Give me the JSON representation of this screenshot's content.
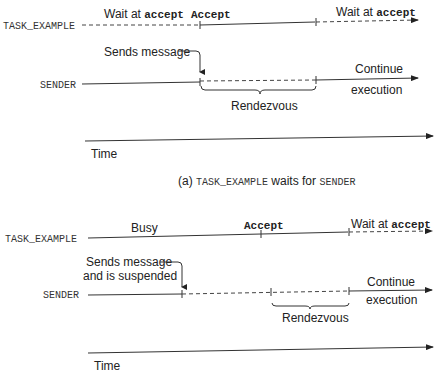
{
  "panel_a": {
    "caption_prefix": "(a) ",
    "caption_task": "TASK_EXAMPLE",
    "caption_mid": " waits for ",
    "caption_sender": "SENDER",
    "task_label": "TASK_EXAMPLE",
    "sender_label": "SENDER",
    "wait_prefix_1": "Wait at ",
    "wait_kw_1": "accept",
    "accept_label": "Accept",
    "wait_prefix_2": "Wait at ",
    "wait_kw_2": "accept",
    "sends_message": "Sends message",
    "continue_1": "Continue",
    "continue_2": "execution",
    "rendezvous": "Rendezvous",
    "time": "Time"
  },
  "panel_b": {
    "task_label": "TASK_EXAMPLE",
    "sender_label": "SENDER",
    "busy": "Busy",
    "accept_label": "Accept",
    "wait_prefix": "Wait at ",
    "wait_kw": "accept",
    "sends_message_1": "Sends message",
    "sends_message_2": "and is suspended",
    "continue_1": "Continue",
    "continue_2": "execution",
    "rendezvous": "Rendezvous",
    "time": "Time"
  }
}
